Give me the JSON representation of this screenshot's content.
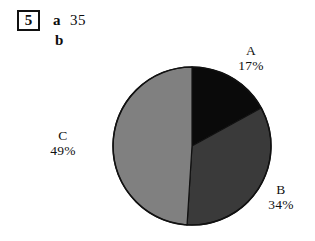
{
  "exercise": {
    "number": "5",
    "part_a_label": "a",
    "part_a_answer": "35",
    "part_b_label": "b"
  },
  "chart_data": {
    "type": "pie",
    "title": "",
    "categories": [
      "A",
      "B",
      "C"
    ],
    "values": [
      17,
      34,
      49
    ],
    "unit": "%",
    "labels": [
      {
        "name": "A",
        "percent": "17%",
        "value": 17,
        "color": "#0a0a0a"
      },
      {
        "name": "B",
        "percent": "34%",
        "value": 34,
        "color": "#3a3a3a"
      },
      {
        "name": "C",
        "percent": "49%",
        "value": 49,
        "color": "#808080"
      }
    ],
    "start_angle_deg": 0,
    "direction": "clockwise",
    "legend": "none",
    "grid": false,
    "outline_color": "#111111"
  }
}
